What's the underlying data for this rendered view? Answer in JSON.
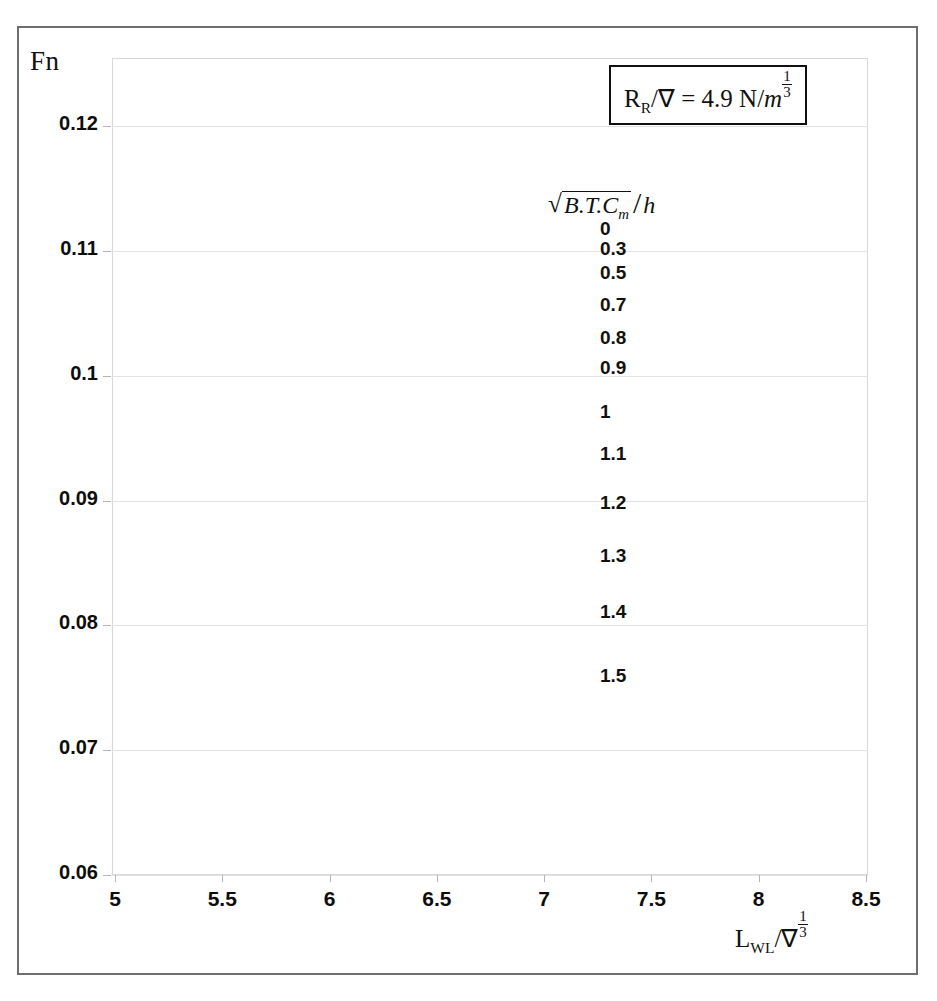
{
  "axes": {
    "y_title": "Fn",
    "x_title_parts": {
      "main": "L",
      "sub": "WL",
      "slash": "/",
      "nabla": "∇",
      "exp_num": "1",
      "exp_den": "3"
    },
    "x_ticks": [
      "5",
      "5.5",
      "6",
      "6.5",
      "7",
      "7.5",
      "8",
      "8.5"
    ],
    "y_ticks": [
      "0.12",
      "0.11",
      "0.1",
      "0.09",
      "0.08",
      "0.07",
      "0.06"
    ]
  },
  "annotation": {
    "text_plain": "R_R/∇ = 4.9 N/m^(1/3)",
    "lead": "R",
    "lead_sub": "R",
    "slash": "/",
    "nabla": "∇",
    "equals": "= 4.9 N/",
    "unit": "m",
    "exp_num": "1",
    "exp_den": "3"
  },
  "legend": {
    "title_plain": "√(B.T.C_m) / h",
    "radicand": "B.T.C",
    "radicand_sub": "m",
    "divider": "/",
    "denominator": "h",
    "labels": [
      "0",
      "0.3",
      "0.5",
      "0.7",
      "0.8",
      "0.9",
      "1",
      "1.1",
      "1.2",
      "1.3",
      "1.4",
      "1.5"
    ]
  },
  "chart_data": {
    "type": "line",
    "title": "",
    "xlabel": "L_WL/∇^(1/3)",
    "ylabel": "Fn",
    "xlim": [
      5,
      8.5
    ],
    "ylim": [
      0.06,
      0.12
    ],
    "grid": true,
    "legend_position": "inside-upper-right",
    "annotation": "R_R/∇ = 4.9 N/m^(1/3)",
    "legend_title": "√(B.T.C_m)/h",
    "x": [
      5.2,
      5.4,
      5.6,
      5.8,
      5.95,
      6.05,
      6.2,
      6.4,
      6.6,
      6.8,
      7.0,
      7.2,
      7.4,
      7.6,
      7.8,
      8.0,
      8.2,
      8.4
    ],
    "series": [
      {
        "name": "0",
        "values": [
          0.101,
          0.109,
          0.115,
          0.1192,
          0.1202,
          0.1203,
          0.1197,
          0.1178,
          0.1154,
          0.1128,
          0.1101,
          0.1074,
          0.1046,
          0.1019,
          0.0993,
          0.0968,
          0.0946,
          0.0943
        ]
      },
      {
        "name": "0.3",
        "values": [
          0.0995,
          0.1076,
          0.1136,
          0.1181,
          0.1192,
          0.1193,
          0.1187,
          0.1168,
          0.1144,
          0.1118,
          0.1091,
          0.1064,
          0.1036,
          0.1009,
          0.0983,
          0.0959,
          0.0938,
          0.0935
        ]
      },
      {
        "name": "0.5",
        "values": [
          0.0981,
          0.1061,
          0.1123,
          0.117,
          0.1181,
          0.1182,
          0.1177,
          0.1158,
          0.1134,
          0.1108,
          0.1081,
          0.1054,
          0.1027,
          0.1,
          0.0975,
          0.0951,
          0.093,
          0.0927
        ]
      },
      {
        "name": "0.7",
        "values": [
          0.094,
          0.1021,
          0.1086,
          0.114,
          0.1155,
          0.1156,
          0.1151,
          0.1132,
          0.1108,
          0.1083,
          0.1057,
          0.1031,
          0.1004,
          0.0978,
          0.0953,
          0.093,
          0.0911,
          0.0908
        ]
      },
      {
        "name": "0.8",
        "values": [
          0.0908,
          0.0989,
          0.1057,
          0.1117,
          0.1136,
          0.1138,
          0.1133,
          0.1115,
          0.1092,
          0.1067,
          0.1042,
          0.1016,
          0.099,
          0.0964,
          0.094,
          0.0918,
          0.0899,
          0.0896
        ]
      },
      {
        "name": "0.9",
        "values": [
          0.088,
          0.096,
          0.103,
          0.1093,
          0.1113,
          0.1115,
          0.1111,
          0.1094,
          0.1071,
          0.1047,
          0.1022,
          0.0997,
          0.0972,
          0.0947,
          0.0923,
          0.0901,
          0.0883,
          0.088
        ]
      },
      {
        "name": "1",
        "values": [
          0.0836,
          0.0916,
          0.0988,
          0.1056,
          0.1079,
          0.1081,
          0.1077,
          0.1061,
          0.1039,
          0.1016,
          0.0992,
          0.0967,
          0.0943,
          0.0919,
          0.0896,
          0.0875,
          0.0858,
          0.0855
        ]
      },
      {
        "name": "1.1",
        "values": [
          0.0794,
          0.0873,
          0.0946,
          0.1017,
          0.1041,
          0.1044,
          0.104,
          0.1024,
          0.1003,
          0.0981,
          0.0957,
          0.0934,
          0.091,
          0.0887,
          0.0865,
          0.0845,
          0.0828,
          0.0825
        ]
      },
      {
        "name": "1.2",
        "values": [
          0.0742,
          0.082,
          0.0893,
          0.0969,
          0.0995,
          0.0998,
          0.0995,
          0.098,
          0.096,
          0.0938,
          0.0916,
          0.0893,
          0.087,
          0.0848,
          0.0827,
          0.0808,
          0.0792,
          0.0789
        ]
      },
      {
        "name": "1.3",
        "values": [
          0.0688,
          0.0765,
          0.0838,
          0.0916,
          0.094,
          0.0942,
          0.0939,
          0.0925,
          0.0906,
          0.0885,
          0.0864,
          0.0842,
          0.082,
          0.0799,
          0.0779,
          0.076,
          0.0745,
          0.0742
        ]
      },
      {
        "name": "1.4",
        "values": [
          0.0638,
          0.0712,
          0.0785,
          0.0861,
          0.0879,
          0.0881,
          0.0878,
          0.0864,
          0.0846,
          0.0826,
          0.0806,
          0.0785,
          0.0764,
          0.0744,
          0.0725,
          0.0707,
          0.0692,
          0.0689
        ]
      },
      {
        "name": "1.5",
        "values": [
          0.0562,
          0.064,
          0.0718,
          0.0796,
          0.0814,
          0.0815,
          0.0812,
          0.0799,
          0.0782,
          0.0763,
          0.0744,
          0.0724,
          0.0705,
          0.0686,
          0.0668,
          0.0651,
          0.0637,
          0.0634
        ]
      }
    ]
  }
}
